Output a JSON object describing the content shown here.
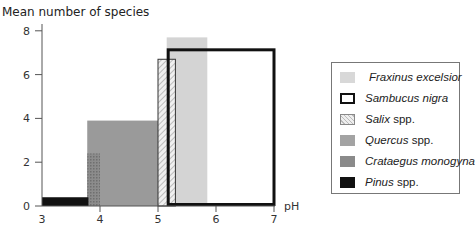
{
  "chart_data": {
    "type": "bar",
    "title": "",
    "ylabel": "Mean number of species",
    "xlabel": "pH",
    "xlim": [
      3,
      7
    ],
    "ylim": [
      0,
      8
    ],
    "x_ticks": [
      3,
      4,
      5,
      6,
      7
    ],
    "y_ticks": [
      0,
      2,
      4,
      6,
      8
    ],
    "grid": false,
    "legend_position": "right",
    "series": [
      {
        "name": "Fraxinus excelsior",
        "genus_italic": "Fraxinus excelsior",
        "suffix": "",
        "ph_min": 5.15,
        "ph_max": 5.85,
        "value": 7.7,
        "style": "light-gray-fill",
        "color": "#d4d4d4"
      },
      {
        "name": "Sambucus nigra",
        "genus_italic": "Sambucus nigra",
        "suffix": "",
        "ph_min": 5.15,
        "ph_max": 7.0,
        "value": 7.2,
        "style": "thick-black-outline",
        "color": "#111111"
      },
      {
        "name": "Salix spp.",
        "genus_italic": "Salix",
        "suffix": " spp.",
        "ph_min": 5.0,
        "ph_max": 5.3,
        "value": 6.7,
        "style": "hatched",
        "color": "#bbbbbb"
      },
      {
        "name": "Quercus spp.",
        "genus_italic": "Quercus",
        "suffix": " spp.",
        "ph_min": 3.78,
        "ph_max": 5.0,
        "value": 3.9,
        "style": "medium-gray-fill",
        "color": "#9a9a9a"
      },
      {
        "name": "Crataegus monogyna",
        "genus_italic": "Crataegus monogyna",
        "suffix": "",
        "ph_min": 3.78,
        "ph_max": 4.0,
        "value": 2.4,
        "style": "dotted-dark-gray",
        "color": "#858585"
      },
      {
        "name": "Pinus spp.",
        "genus_italic": "Pinus",
        "suffix": " spp.",
        "ph_min": 3.0,
        "ph_max": 3.8,
        "value": 0.4,
        "style": "black-fill",
        "color": "#111111"
      }
    ]
  }
}
